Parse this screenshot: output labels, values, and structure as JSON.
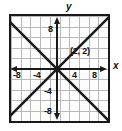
{
  "figure": {
    "kind": "coordinate-plane-graph",
    "background_color": "#ffffff",
    "frame_color": "#1a1a1a",
    "grid_color": "#b9b9b9",
    "line_color": "#1a1a1a"
  },
  "axes": {
    "x_axis_label": "x",
    "y_axis_label": "y",
    "x_ticks": [
      {
        "label": "-8",
        "value": -8
      },
      {
        "label": "-4",
        "value": -4
      },
      {
        "label": "4",
        "value": 4
      },
      {
        "label": "8",
        "value": 8
      }
    ],
    "y_ticks": [
      {
        "label": "8",
        "value": 8
      },
      {
        "label": "-4",
        "value": -4
      },
      {
        "label": "-8",
        "value": -8
      }
    ]
  },
  "annotations": {
    "intersection_point": "(2, 2)"
  },
  "chart_data": {
    "type": "line",
    "title": "",
    "xlabel": "x",
    "ylabel": "y",
    "xlim": [
      -10,
      10
    ],
    "ylim": [
      -10,
      10
    ],
    "grid": true,
    "grid_step": 2,
    "legend": "none",
    "series": [
      {
        "name": "line-positive-slope",
        "equation": "y = x",
        "slope": 1,
        "intercept": 0,
        "x": [
          -10,
          10
        ],
        "values": [
          -10,
          10
        ]
      },
      {
        "name": "line-negative-slope",
        "equation": "y = -x + 4",
        "slope": -1,
        "intercept": 4,
        "x": [
          -10,
          10
        ],
        "values": [
          14,
          -6
        ]
      }
    ],
    "annotations": [
      {
        "text": "(2, 2)",
        "x": 2,
        "y": 2
      }
    ],
    "xticks": [
      -8,
      -4,
      4,
      8
    ],
    "yticks": [
      8,
      -4,
      -8
    ]
  }
}
